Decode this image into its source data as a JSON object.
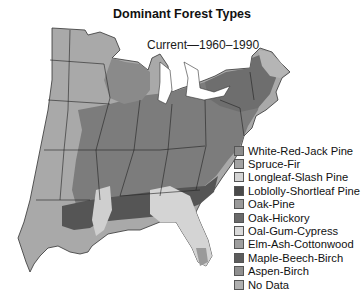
{
  "title": "Dominant Forest Types",
  "subtitle": "Current—1960–1990",
  "map": {
    "region": "Eastern United States",
    "colors": {
      "plains": "#a9a9a9",
      "oak_hickory": "#7a7a7a",
      "maple_beech": "#6e6e6e",
      "loblolly": "#555555",
      "longleaf": "#d6d6d6",
      "oak_gum": "#cfcfcf",
      "spruce_fir": "#b8b8b8",
      "boundary": "#222222",
      "water": "#ffffff"
    }
  },
  "legend": {
    "items": [
      {
        "label": "White-Red-Jack Pine",
        "color": "#8c8c8c"
      },
      {
        "label": "Spruce-Fir",
        "color": "#a3a3a3"
      },
      {
        "label": "Longleaf-Slash Pine",
        "color": "#d4d4d4"
      },
      {
        "label": "Loblolly-Shortleaf Pine",
        "color": "#4a4a4a"
      },
      {
        "label": "Oak-Pine",
        "color": "#9a9a9a"
      },
      {
        "label": "Oak-Hickory",
        "color": "#6a6a6a"
      },
      {
        "label": "Oal-Gum-Cypress",
        "color": "#d9d9d9"
      },
      {
        "label": "Elm-Ash-Cottonwood",
        "color": "#9e9e9e"
      },
      {
        "label": "Maple-Beech-Birch",
        "color": "#5c5c5c"
      },
      {
        "label": "Aspen-Birch",
        "color": "#8f8f8f"
      },
      {
        "label": "No Data",
        "color": "#b0b0b0"
      }
    ]
  }
}
